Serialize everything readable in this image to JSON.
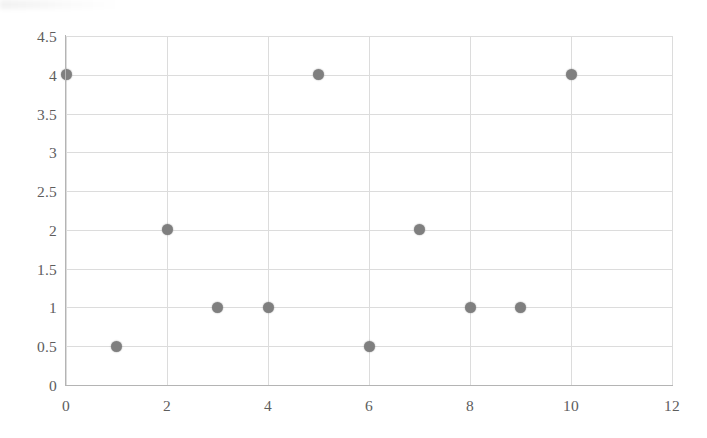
{
  "chart_data": {
    "type": "scatter",
    "title": "",
    "subtitle": "",
    "xlabel": "",
    "ylabel": "",
    "xlim": [
      0,
      12
    ],
    "ylim": [
      0,
      4.5
    ],
    "grid": true,
    "legend": null,
    "legend_position": "none",
    "marker_color": "#7f7f7f",
    "gridline_color": "#dcdcdc",
    "axis_color": "#b4b4b4",
    "tick_label_color": "#5d5d5d",
    "background_color": "#ffffff",
    "xticks": [
      0,
      2,
      4,
      6,
      8,
      10,
      12
    ],
    "xtick_labels": [
      "0",
      "2",
      "4",
      "6",
      "8",
      "10",
      "12"
    ],
    "yticks": [
      0,
      0.5,
      1,
      1.5,
      2,
      2.5,
      3,
      3.5,
      4,
      4.5
    ],
    "ytick_labels": [
      "0",
      "0.5",
      "1",
      "1.5",
      "2",
      "2.5",
      "3",
      "3.5",
      "4",
      "4.5"
    ],
    "x": [
      0,
      1,
      2,
      3,
      4,
      5,
      6,
      7,
      8,
      9,
      10
    ],
    "y": [
      4,
      0.5,
      2,
      1,
      1,
      4,
      0.5,
      2,
      1,
      1,
      4
    ],
    "points": [
      {
        "x": 0,
        "y": 4
      },
      {
        "x": 1,
        "y": 0.5
      },
      {
        "x": 2,
        "y": 2
      },
      {
        "x": 3,
        "y": 1
      },
      {
        "x": 4,
        "y": 1
      },
      {
        "x": 5,
        "y": 4
      },
      {
        "x": 6,
        "y": 0.5
      },
      {
        "x": 7,
        "y": 2
      },
      {
        "x": 8,
        "y": 1
      },
      {
        "x": 9,
        "y": 1
      },
      {
        "x": 10,
        "y": 4
      }
    ]
  }
}
